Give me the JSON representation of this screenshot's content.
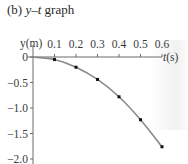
{
  "caption": {
    "prefix": "(b) ",
    "var_y": "y",
    "dash": "–",
    "var_t": "t",
    "suffix": " graph"
  },
  "chart_data": {
    "type": "line",
    "title": "(b) y–t graph",
    "xlabel": "t(s)",
    "ylabel": "y(m)",
    "x_ticks": [
      "0.1",
      "0.2",
      "0.3",
      "0.4",
      "0.5",
      "0.6"
    ],
    "y_ticks": [
      "0",
      "−0.5",
      "−1.0",
      "−1.5",
      "−2.0"
    ],
    "xlim": [
      0,
      0.6
    ],
    "ylim": [
      -2.0,
      0
    ],
    "grid": false,
    "legend": null,
    "series": [
      {
        "name": "y(t)",
        "x": [
          0.1,
          0.2,
          0.3,
          0.4,
          0.5,
          0.6
        ],
        "values": [
          -0.05,
          -0.2,
          -0.44,
          -0.78,
          -1.23,
          -1.76
        ],
        "markers": true,
        "smooth_curve_from_origin": true
      }
    ],
    "colors": {
      "curve": "#8a8a8a",
      "points": "#111111",
      "axes": "#6a6a6a"
    }
  }
}
